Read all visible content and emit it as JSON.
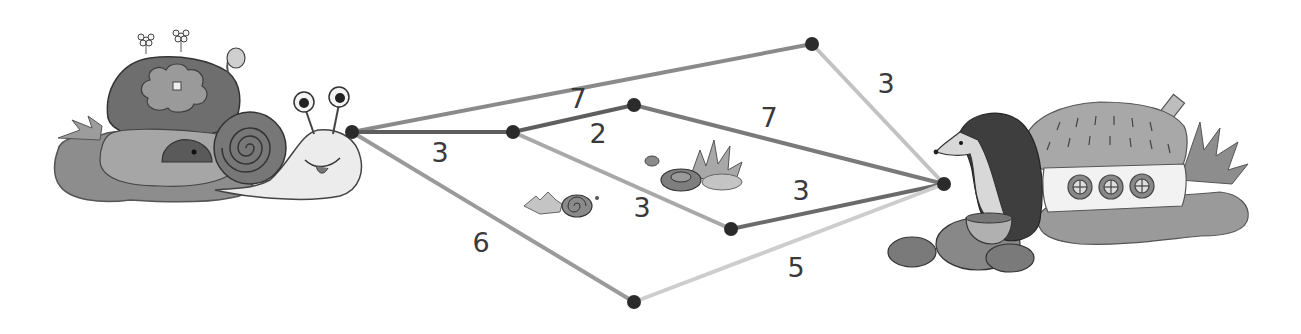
{
  "diagram": {
    "start": {
      "label": "snail-house",
      "node": "A"
    },
    "end": {
      "label": "hedgehog-house",
      "node": "E"
    },
    "nodes": [
      {
        "id": "A",
        "x": 352,
        "y": 132
      },
      {
        "id": "B",
        "x": 513,
        "y": 132
      },
      {
        "id": "C",
        "x": 634,
        "y": 105
      },
      {
        "id": "D",
        "x": 812,
        "y": 44
      },
      {
        "id": "E",
        "x": 944,
        "y": 184
      },
      {
        "id": "F",
        "x": 634,
        "y": 302
      },
      {
        "id": "G",
        "x": 731,
        "y": 229
      }
    ],
    "edges": [
      {
        "from": "A",
        "to": "D",
        "weight": "7",
        "shade": "#8a8a8a",
        "lx": 578,
        "ly": 106
      },
      {
        "from": "A",
        "to": "B",
        "weight": "3",
        "shade": "#5e5e5e",
        "lx": 440,
        "ly": 160
      },
      {
        "from": "A",
        "to": "F",
        "weight": "6",
        "shade": "#9a9a9a",
        "lx": 481,
        "ly": 250
      },
      {
        "from": "B",
        "to": "C",
        "weight": "2",
        "shade": "#5e5e5e",
        "lx": 598,
        "ly": 141
      },
      {
        "from": "B",
        "to": "G",
        "weight": "3",
        "shade": "#a8a8a8",
        "lx": 642,
        "ly": 215
      },
      {
        "from": "C",
        "to": "E",
        "weight": "7",
        "shade": "#7a7a7a",
        "lx": 769,
        "ly": 125
      },
      {
        "from": "D",
        "to": "E",
        "weight": "3",
        "shade": "#c2c2c2",
        "lx": 886,
        "ly": 91
      },
      {
        "from": "G",
        "to": "E",
        "weight": "3",
        "shade": "#6a6a6a",
        "lx": 801,
        "ly": 198
      },
      {
        "from": "F",
        "to": "E",
        "weight": "5",
        "shade": "#cdcdcd",
        "lx": 796,
        "ly": 275
      }
    ]
  },
  "labels": {
    "w_AD": "7",
    "w_AB": "3",
    "w_AF": "6",
    "w_BC": "2",
    "w_BG": "3",
    "w_CE": "7",
    "w_DE": "3",
    "w_GE": "3",
    "w_FE": "5"
  },
  "colors": {
    "node": "#2b2b2b",
    "edge_dark": "#5e5e5e",
    "edge_mid": "#8a8a8a",
    "edge_light": "#c6c6c6",
    "label": "#3a3a3a"
  }
}
